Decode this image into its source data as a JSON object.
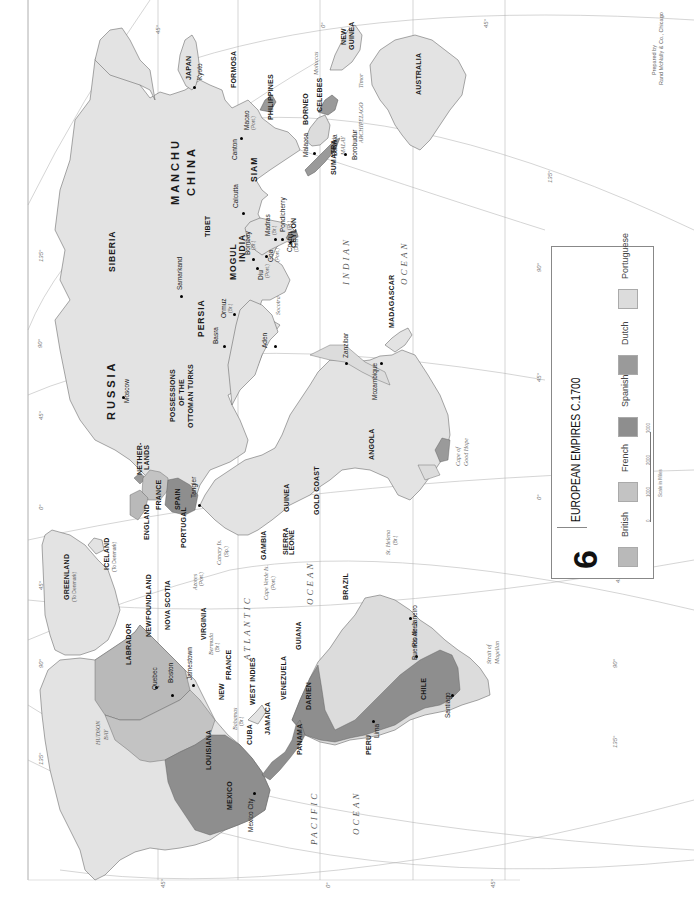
{
  "map": {
    "plate_number": "6",
    "title": "EUROPEAN EMPIRES  C.1700",
    "credit_line1": "Prepared by",
    "credit_line2": "Rand McNally & Co., Chicago",
    "colors": {
      "background": "#ffffff",
      "land": "#e3e3e3",
      "british": "#b9b9b9",
      "french": "#c3c3c3",
      "spanish": "#8e8e8e",
      "dutch": "#9a9a9a",
      "portuguese": "#dcdcdc",
      "border": "#555555"
    }
  },
  "legend": {
    "items": [
      {
        "name": "British",
        "color": "#b9b9b9"
      },
      {
        "name": "French",
        "color": "#c3c3c3"
      },
      {
        "name": "Spanish",
        "color": "#8e8e8e"
      },
      {
        "name": "Dutch",
        "color": "#9a9a9a"
      },
      {
        "name": "Portuguese",
        "color": "#dcdcdc"
      }
    ],
    "scale": {
      "ticks": [
        "0",
        "1000",
        "2000",
        "3000"
      ],
      "label": "Scale in Miles"
    }
  },
  "oceans": {
    "pacific": "PACIFIC",
    "pacific_ocean": "OCEAN",
    "atlantic": "ATLANTIC",
    "atlantic_ocean": "OCEAN",
    "indian": "INDIAN",
    "indian_ocean": "OCEAN"
  },
  "regions": {
    "siberia": "SIBERIA",
    "russia": "RUSSIA",
    "manchu": "MANCHU",
    "china": "CHINA",
    "japan": "JAPAN",
    "tibet": "TIBET",
    "mogul": "MOGUL",
    "india": "INDIA",
    "persia": "PERSIA",
    "siam": "SIAM",
    "ottoman_1": "POSSESSIONS",
    "ottoman_2": "OF THE",
    "ottoman_3": "OTTOMAN TURKS",
    "netherlands_1": "NETHER-",
    "netherlands_2": "LANDS",
    "france": "FRANCE",
    "england": "ENGLAND",
    "spain": "SPAIN",
    "portugal": "PORTUGAL",
    "greenland": "GREENLAND",
    "greenland_sub": "(To Denmark)",
    "iceland": "ICELAND",
    "iceland_sub": "(To Denmark)",
    "newfoundland": "NEWFOUNDLAND",
    "labrador": "LABRADOR",
    "nova_scotia": "NOVA SCOTIA",
    "virginia": "VIRGINIA",
    "new_france_1": "NEW",
    "new_france_2": "FRANCE",
    "louisiana": "LOUISIANA",
    "mexico": "MEXICO",
    "cuba": "CUBA",
    "jamaica": "JAMAICA",
    "west_indies": "WEST INDIES",
    "panama": "PANAMA",
    "venezuela": "VENEZUELA",
    "guiana": "GUIANA",
    "darien": "DARIEN",
    "peru": "PERU",
    "chile": "CHILE",
    "brazil": "BRAZIL",
    "gambia": "GAMBIA",
    "sierra_leone_1": "SIERRA",
    "sierra_leone_2": "LEONE",
    "guinea": "GUINEA",
    "gold_coast": "GOLD COAST",
    "angola": "ANGOLA",
    "madagascar": "MADAGASCAR",
    "ceylon": "CEYLON",
    "sumatra": "SUMATRA",
    "borneo": "BORNEO",
    "celebes": "CELEBES",
    "philippines": "PHILIPPINES",
    "formosa": "FORMOSA",
    "new_guinea_1": "NEW",
    "new_guinea_2": "GUINEA",
    "australia": "AUSTRALIA",
    "malay_1": "MALAY",
    "malay_2": "ARCHIPELAGO",
    "hudson_bay_1": "HUDSON",
    "hudson_bay_2": "BAY"
  },
  "places": {
    "kyoto": "Kyoto",
    "macao": "Macao",
    "macao_sub": "(Port.)",
    "canton": "Canton",
    "calcutta": "Calcutta",
    "calcutta_sub": "(Br.)",
    "madras": "Madras",
    "madras_sub": "(Br.)",
    "pondicherry": "Pondicherry",
    "pondicherry_sub": "(Fr.)",
    "bombay": "Bombay",
    "bombay_sub": "(Br.)",
    "goa": "Goa",
    "goa_sub": "(Port.)",
    "diu": "Diu",
    "diu_sub": "(Port.)",
    "cochin": "Cochin",
    "cochin_sub": "(Dutch)",
    "samarkand": "Samarkand",
    "ormuz": "Ormuz",
    "ormuz_sub": "(Br.)",
    "basra": "Basra",
    "aden": "Aden",
    "socotra": "Socotra",
    "moscow": "Moscow",
    "tangier": "Tangier",
    "zanzibar": "Zanzibar",
    "mozambique": "Mozambique",
    "cape_1": "Cape of",
    "cape_2": "Good Hope",
    "st_helena": "St. Helena",
    "st_helena_sub": "(Br.)",
    "malacca": "Malacca",
    "batavia": "Batavia",
    "borobudur": "Borobudur",
    "bali": "Bali",
    "timor": "Timor",
    "moluccas": "Moluccas",
    "moluccas_sub": "(Dutch)",
    "quebec": "Quebec",
    "boston": "Boston",
    "jamestown": "Jamestown",
    "mexico_city": "Mexico City",
    "lima": "Lima",
    "santiago": "Santiago",
    "buenos_aires": "Buenos Aires",
    "rio": "Rio de Janeiro",
    "bermuda": "Bermuda",
    "bermuda_sub": "(Br.)",
    "bahamas": "Bahamas",
    "bahamas_sub": "(Br.)",
    "azores": "Azores",
    "azores_sub": "(Port.)",
    "canary": "Canary Is.",
    "canary_sub": "(Sp.)",
    "cape_verde": "Cape Verde Is.",
    "cape_verde_sub": "(Port.)",
    "strait_1": "Strait of",
    "strait_2": "Magellan",
    "persian_gulf": "PERSIAN GULF",
    "red_sea": "RED SEA",
    "black_sea": "BLACK SEA",
    "caspian": "CASPIAN SEA",
    "med": "MEDITERRANEAN SEA"
  },
  "graticule": {
    "lon_0": "0°",
    "lon_45": "45°",
    "lon_90": "90°",
    "lon_135": "135°"
  }
}
